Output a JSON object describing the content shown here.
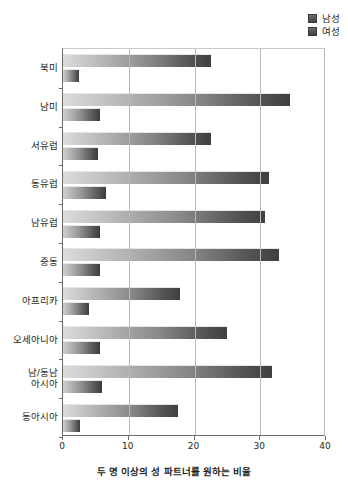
{
  "chart_data": {
    "type": "bar",
    "orientation": "horizontal",
    "title": "",
    "xlabel": "두 명 이상의 성 파트너를 원하는 비율",
    "ylabel": "",
    "xlim": [
      0,
      40
    ],
    "xticks": [
      0,
      10,
      20,
      30,
      40
    ],
    "grid": true,
    "legend_position": "top-right",
    "categories": [
      "북미",
      "남미",
      "서유럽",
      "동유럽",
      "남유럽",
      "중동",
      "아프리카",
      "오세아니아",
      "남/동남\n아시아",
      "동아시아"
    ],
    "series": [
      {
        "name": "남성",
        "color": "#4a4a4a",
        "values": [
          22.5,
          34.5,
          22.5,
          31.3,
          30.7,
          32.8,
          17.8,
          25.0,
          31.8,
          17.5
        ]
      },
      {
        "name": "여성",
        "color": "#4a4a4a",
        "values": [
          2.5,
          5.7,
          5.3,
          6.5,
          5.6,
          5.6,
          4.0,
          5.6,
          5.9,
          2.6
        ]
      }
    ]
  },
  "legend": {
    "items": [
      {
        "label": "남성"
      },
      {
        "label": "여성"
      }
    ]
  },
  "axis": {
    "x_title": "두 명 이상의 성 파트너를 원하는 비율",
    "tick_labels": [
      "0",
      "10",
      "20",
      "30",
      "40"
    ]
  }
}
